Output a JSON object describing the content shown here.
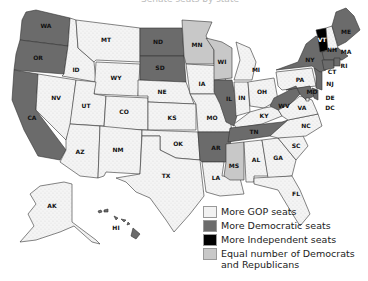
{
  "title": "Senate seats by state",
  "colors": {
    "gop": "#f2f2f2",
    "dem": "#6b6b6b",
    "ind": "#000000",
    "equal": "#c8c8c8"
  },
  "legend": [
    {
      "key": "gop",
      "label": "More GOP seats"
    },
    {
      "key": "dem",
      "label": "More Democratic seats"
    },
    {
      "key": "ind",
      "label": "More Independent seats"
    },
    {
      "key": "equal",
      "label": "Equal number of Democrats and Republicans",
      "line1": "Equal number of Democrats",
      "line2": "and Republicans"
    }
  ],
  "states": {
    "WA": "dem",
    "OR": "dem",
    "CA": "dem",
    "NV": "gop",
    "ID": "gop",
    "MT": "gop",
    "WY": "gop",
    "UT": "gop",
    "CO": "gop",
    "AZ": "gop",
    "NM": "gop",
    "ND": "dem",
    "SD": "dem",
    "NE": "gop",
    "KS": "gop",
    "OK": "gop",
    "TX": "gop",
    "MN": "equal",
    "IA": "gop",
    "MO": "gop",
    "AR": "dem",
    "LA": "gop",
    "WI": "equal",
    "IL": "dem",
    "MI": "gop",
    "IN": "gop",
    "OH": "gop",
    "KY": "gop",
    "TN": "dem",
    "MS": "equal",
    "AL": "gop",
    "GA": "gop",
    "FL": "gop",
    "SC": "gop",
    "NC": "gop",
    "VA": "gop",
    "WV": "dem",
    "PA": "gop",
    "NY": "dem",
    "VT": "ind",
    "NH": "gop",
    "ME": "dem",
    "MA": "dem",
    "RI": "dem",
    "CT": "dem",
    "NJ": "dem",
    "DE": "dem",
    "MD": "dem",
    "DC": "gop",
    "AK": "gop",
    "HI": "dem"
  }
}
